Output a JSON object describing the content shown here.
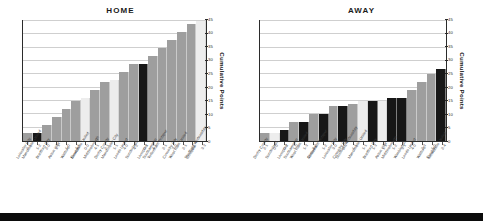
{
  "charts": [
    {
      "id": "home",
      "title": "HOME",
      "ylabel": "Cumulative Points"
    },
    {
      "id": "away",
      "title": "AWAY",
      "ylabel": "Cumulative Points"
    }
  ],
  "chart_data": [
    {
      "type": "bar",
      "title": "HOME",
      "xlabel": "",
      "ylabel": "Cumulative Points",
      "ylim": [
        0,
        45
      ],
      "yticks": [
        0,
        5,
        10,
        15,
        20,
        25,
        30,
        35,
        40,
        45
      ],
      "grid": true,
      "legend": "none",
      "categories": [
        "Leicester City",
        "Manchester United",
        "Bradford City",
        "Aston Villa",
        "Watford",
        "Everton",
        "Newcastle United",
        "Middlesbrough",
        "Derby County",
        "Manchester City",
        "Leeds United",
        "Sunderland",
        "Liverpool",
        "Southampton",
        "Tottenham Hotspur",
        "Coventry City",
        "West Ham United",
        "Chelsea",
        "Sheffield Wednesday"
      ],
      "scores": [
        "2-1",
        "1-2",
        "2-0",
        "3-1",
        "1-0",
        "4-1",
        "0-0",
        "4-1",
        "2-1",
        "1-1",
        "4-0",
        "4-2",
        "0-1",
        "4-1",
        "2-1",
        "3-0",
        "2-1",
        "2-1",
        "3-3"
      ],
      "values": [
        3,
        3,
        6,
        9,
        12,
        15,
        16,
        19,
        22,
        23,
        26,
        29,
        29,
        32,
        35,
        38,
        41,
        44,
        45
      ],
      "bar_colors": [
        "gray",
        "dark",
        "gray",
        "gray",
        "gray",
        "gray",
        "light",
        "gray",
        "gray",
        "light",
        "gray",
        "gray",
        "dark",
        "gray",
        "gray",
        "gray",
        "gray",
        "gray",
        "light"
      ]
    },
    {
      "type": "bar",
      "title": "AWAY",
      "xlabel": "",
      "ylabel": "Cumulative Points",
      "ylim": [
        0,
        45
      ],
      "yticks": [
        0,
        5,
        10,
        15,
        20,
        25,
        30,
        35,
        40,
        45
      ],
      "grid": true,
      "legend": "none",
      "categories": [
        "Derby County",
        "Sunderland",
        "Liverpool",
        "Southampton",
        "West Ham United",
        "Chelsea",
        "Tottenham Hotspur",
        "Leicester City",
        "Coventry City",
        "Sheffield Wednesday",
        "Manchester United",
        "Bradford City",
        "Aston Villa",
        "Middlesbrough",
        "Wimbledon",
        "Leeds United",
        "Watford",
        "Everton",
        "Newcastle United"
      ],
      "scores": [
        "2-1",
        "0-0",
        "0-2",
        "1-0",
        "1-3",
        "3-2",
        "1-2",
        "3-0",
        "2-3",
        "1-1",
        "1-1",
        "1-3",
        "1-1",
        "1-2",
        "3-1",
        "4-0",
        "2-3",
        "1-0",
        "2-4"
      ],
      "values": [
        3,
        3,
        4,
        7,
        7,
        10,
        10,
        13,
        13,
        14,
        15,
        15,
        15,
        16,
        16,
        19,
        22,
        25,
        27
      ],
      "bar_colors": [
        "gray",
        "light",
        "dark",
        "gray",
        "dark",
        "gray",
        "dark",
        "gray",
        "dark",
        "gray",
        "light",
        "dark",
        "light",
        "dark",
        "dark",
        "gray",
        "gray",
        "gray",
        "dark"
      ]
    }
  ]
}
